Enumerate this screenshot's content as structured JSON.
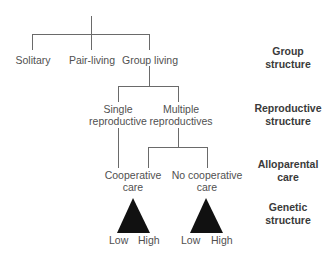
{
  "tree": {
    "level1": [
      {
        "id": "solitary",
        "label": "Solitary"
      },
      {
        "id": "pair-living",
        "label": "Pair-living"
      },
      {
        "id": "group-living",
        "label": "Group living"
      }
    ],
    "level2": [
      {
        "id": "single-reproductive",
        "line1": "Single",
        "line2": "reproductive"
      },
      {
        "id": "multiple-reproductives",
        "line1": "Multiple",
        "line2": "reproductives"
      }
    ],
    "level3": [
      {
        "id": "cooperative-care",
        "line1": "Cooperative",
        "line2": "care"
      },
      {
        "id": "no-cooperative-care",
        "line1": "No cooperative",
        "line2": "care"
      }
    ],
    "genetic_scales": [
      {
        "low": "Low",
        "high": "High"
      },
      {
        "low": "Low",
        "high": "High"
      }
    ]
  },
  "levels": [
    {
      "line1": "Group",
      "line2": "structure"
    },
    {
      "line1": "Reproductive",
      "line2": "structure"
    },
    {
      "line1": "Alloparental",
      "line2": "care"
    },
    {
      "line1": "Genetic",
      "line2": "structure"
    }
  ],
  "colors": {
    "line": "#6a6a6a",
    "triangle": "#111111",
    "text": "#505050"
  }
}
